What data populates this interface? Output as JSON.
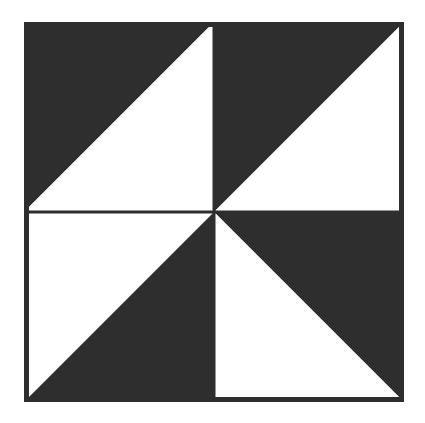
{
  "page": {
    "background_color": "#ffffff",
    "width": 425,
    "height": 423
  },
  "figure": {
    "name": "pinwheel-block",
    "dark_color": "#2e2e2e",
    "light_color": "#ffffff",
    "frame": {
      "x": 24,
      "y": 22,
      "width": 380,
      "height": 380,
      "border_width": 5,
      "stroke_color": "#2e2e2e"
    },
    "center": {
      "x": 214,
      "y": 212
    },
    "dividers": {
      "vertical_x": 214,
      "horizontal_y": 212,
      "line_width": 3,
      "color": "#2e2e2e"
    },
    "quadrants": [
      {
        "name": "top-left",
        "split": "anti-diagonal",
        "dark_half": "lower-left",
        "light_half": "upper-right"
      },
      {
        "name": "top-right",
        "split": "main-diagonal",
        "dark_half": "upper-left",
        "light_half": "lower-right"
      },
      {
        "name": "bottom-left",
        "split": "main-diagonal",
        "dark_half": "lower-right",
        "light_half": "upper-left"
      },
      {
        "name": "bottom-right",
        "split": "anti-diagonal",
        "dark_half": "upper-right",
        "light_half": "lower-left"
      }
    ]
  },
  "chart_data": {
    "type": "diagram",
    "shape": "square",
    "rotational_symmetry": 4,
    "triangles": [
      {
        "id": "tl-dark",
        "quadrant": "top-left",
        "fill": "dark",
        "points": "24,22 24,212 214,22"
      },
      {
        "id": "tl-light",
        "quadrant": "top-left",
        "fill": "light",
        "points": "214,22 24,212 214,212"
      },
      {
        "id": "tr-dark",
        "quadrant": "top-right",
        "fill": "dark",
        "points": "214,22 404,22 214,212"
      },
      {
        "id": "tr-light",
        "quadrant": "top-right",
        "fill": "light",
        "points": "404,22 404,212 214,212"
      },
      {
        "id": "bl-light",
        "quadrant": "bottom-left",
        "fill": "light",
        "points": "24,212 214,212 24,402"
      },
      {
        "id": "bl-dark",
        "quadrant": "bottom-left",
        "fill": "dark",
        "points": "214,212 214,402 24,402"
      },
      {
        "id": "br-dark",
        "quadrant": "bottom-right",
        "fill": "dark",
        "points": "214,212 404,212 404,402"
      },
      {
        "id": "br-light",
        "quadrant": "bottom-right",
        "fill": "light",
        "points": "214,212 404,402 214,402"
      }
    ]
  }
}
